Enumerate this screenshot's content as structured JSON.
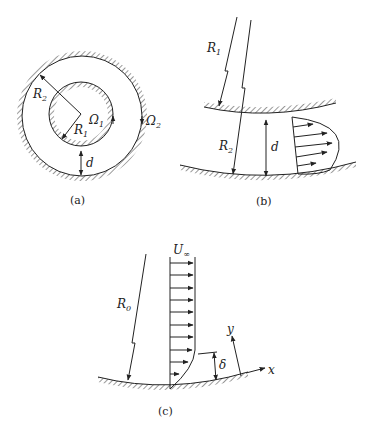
{
  "figure": {
    "panels": [
      {
        "id": "a",
        "caption": "(a)",
        "labels": {
          "R2": "R",
          "R2_sub": "2",
          "R1": "R",
          "R1_sub": "1",
          "Omega1": "Ω",
          "Omega1_sub": "1",
          "Omega2": "Ω",
          "Omega2_sub": "2",
          "d": "d"
        }
      },
      {
        "id": "b",
        "caption": "(b)",
        "labels": {
          "R1": "R",
          "R1_sub": "1",
          "R2": "R",
          "R2_sub": "2",
          "d": "d"
        }
      },
      {
        "id": "c",
        "caption": "(c)",
        "labels": {
          "U": "U",
          "U_sub": "∞",
          "R0": "R",
          "R0_sub": "0",
          "delta": "δ",
          "x": "x",
          "y": "y"
        }
      }
    ]
  },
  "colors": {
    "ink": "#222222",
    "background": "#ffffff"
  }
}
